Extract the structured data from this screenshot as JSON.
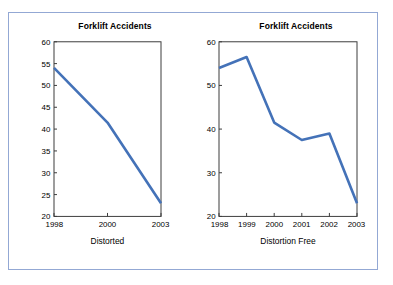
{
  "frame": {
    "border_color": "#93a8d4"
  },
  "series_color": "#4472b8",
  "charts": [
    {
      "id": "distorted",
      "title": "Forklift Accidents",
      "caption": "Distorted",
      "ylim": [
        20,
        60
      ],
      "yticks": [
        20,
        25,
        30,
        35,
        40,
        45,
        50,
        55,
        60
      ],
      "xticks": [
        "1998",
        "2000",
        "2003"
      ],
      "values": [
        54,
        41.5,
        23
      ]
    },
    {
      "id": "distortion-free",
      "title": "Forklift Accidents",
      "caption": "Distortion Free",
      "ylim": [
        20,
        60
      ],
      "yticks": [
        20,
        30,
        40,
        50,
        60
      ],
      "xticks": [
        "1998",
        "1999",
        "2000",
        "2001",
        "2002",
        "2003"
      ],
      "values": [
        54,
        56.5,
        41.5,
        37.5,
        39,
        23
      ]
    }
  ],
  "chart_data": [
    {
      "type": "line",
      "title": "Forklift Accidents",
      "xlabel": "Distorted",
      "ylabel": "",
      "x": [
        "1998",
        "2000",
        "2003"
      ],
      "values": [
        54,
        41.5,
        23
      ],
      "ylim": [
        20,
        60
      ],
      "yticks": [
        20,
        25,
        30,
        35,
        40,
        45,
        50,
        55,
        60
      ],
      "grid": false,
      "legend": "none",
      "series_color": "#4472b8",
      "note": "Y axis truncated at 20 and tick step of 5 exaggerates the decline"
    },
    {
      "type": "line",
      "title": "Forklift Accidents",
      "xlabel": "Distortion Free",
      "ylabel": "",
      "x": [
        "1998",
        "1999",
        "2000",
        "2001",
        "2002",
        "2003"
      ],
      "values": [
        54,
        56.5,
        41.5,
        37.5,
        39,
        23
      ],
      "ylim": [
        20,
        60
      ],
      "yticks": [
        20,
        30,
        40,
        50,
        60
      ],
      "grid": false,
      "legend": "none",
      "series_color": "#4472b8",
      "note": "All years shown with even tick spacing"
    }
  ]
}
